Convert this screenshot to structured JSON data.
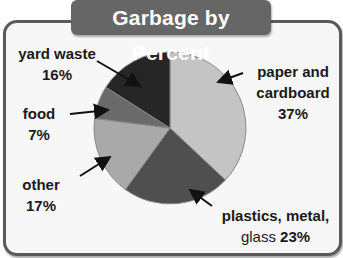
{
  "title": "Garbage by Percent",
  "chart_data": {
    "type": "pie",
    "title": "Garbage by Percent",
    "categories": [
      "paper and cardboard",
      "plastics, metal, glass",
      "other",
      "food",
      "yard waste"
    ],
    "values": [
      37,
      23,
      17,
      7,
      16
    ],
    "unit": "%",
    "start_angle": "12 o'clock",
    "direction": "clockwise",
    "colors": [
      "#c4c4c4",
      "#4f4f4f",
      "#a9a9a9",
      "#6a6a6a",
      "#262626"
    ],
    "legend": "none (direct labels with arrows)"
  },
  "labels": {
    "paper": {
      "name_line1": "paper and",
      "name_line2": "cardboard",
      "pct": "37%"
    },
    "plastics": {
      "name_line1": "plastics, metal,",
      "name_line2": "glass",
      "pct": "23%"
    },
    "other": {
      "name": "other",
      "pct": "17%"
    },
    "food": {
      "name": "food",
      "pct": "7%"
    },
    "yard": {
      "name": "yard waste",
      "pct": "16%"
    }
  }
}
